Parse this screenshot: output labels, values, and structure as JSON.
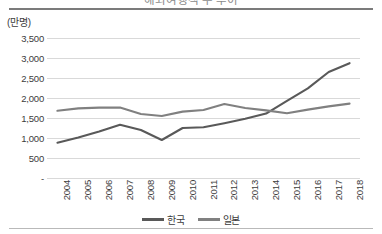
{
  "chart_data": {
    "type": "line",
    "title": "해외여행객 수 추이",
    "unit_label": "(만명)",
    "xlabel": "",
    "ylabel": "",
    "categories": [
      "2004",
      "2005",
      "2006",
      "2007",
      "2008",
      "2009",
      "2010",
      "2011",
      "2012",
      "2013",
      "2014",
      "2015",
      "2016",
      "2017",
      "2018"
    ],
    "ylim": [
      0,
      3500
    ],
    "ytick_values": [
      0,
      500,
      1000,
      1500,
      2000,
      2500,
      3000,
      3500
    ],
    "ytick_labels": [
      "-",
      "500",
      "1,000",
      "1,500",
      "2,000",
      "2,500",
      "3,000",
      "3,500"
    ],
    "grid": true,
    "legend_position": "bottom-center",
    "series": [
      {
        "name": "한국",
        "color": "#595959",
        "values": [
          880,
          1010,
          1160,
          1330,
          1200,
          950,
          1250,
          1270,
          1370,
          1480,
          1610,
          1930,
          2240,
          2650,
          2870
        ]
      },
      {
        "name": "일본",
        "color": "#808080",
        "values": [
          1680,
          1740,
          1760,
          1760,
          1600,
          1550,
          1660,
          1700,
          1850,
          1750,
          1690,
          1620,
          1710,
          1790,
          1860
        ]
      }
    ]
  },
  "legend": {
    "entries": [
      {
        "label": "한국"
      },
      {
        "label": "일본"
      }
    ]
  },
  "colors": {
    "series_korea": "#595959",
    "series_japan": "#808080",
    "gridline": "#d9d9d9",
    "text": "#3c3c3c",
    "rule": "#7b7b7b"
  }
}
